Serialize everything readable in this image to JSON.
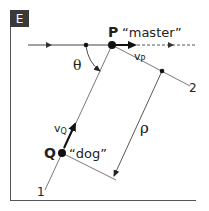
{
  "panel": {
    "label": "E",
    "badge_color": "#3a3a3a",
    "border_color": "#555555"
  },
  "points": {
    "P": {
      "name": "P",
      "quote": "“master”"
    },
    "Q": {
      "name": "Q",
      "quote": "“dog”"
    }
  },
  "labels": {
    "theta": "θ",
    "rho": "ρ",
    "vP": "v",
    "vP_sub": "P",
    "vQ": "v",
    "vQ_sub": "Q",
    "line1": "1",
    "line2": "2"
  },
  "colors": {
    "line": "#444444",
    "dot": "#111111",
    "text": "#222222"
  }
}
